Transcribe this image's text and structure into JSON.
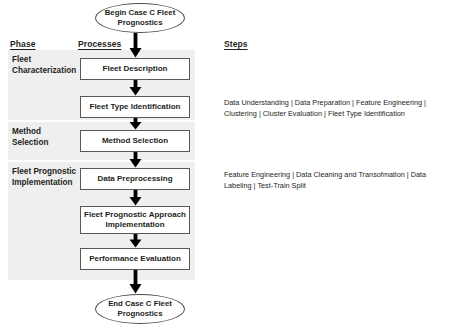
{
  "diagram": {
    "band_color": "#efefef",
    "line_color": "#595959",
    "text_color": "#231f20"
  },
  "headers": {
    "phase": "Phase",
    "processes": "Processes",
    "steps": "Steps"
  },
  "terminators": {
    "start": "Begin Case C Fleet Prognostics",
    "end": "End Case C Fleet Prognostics"
  },
  "phases": [
    {
      "label": "Fleet Characterization"
    },
    {
      "label": "Method Selection"
    },
    {
      "label": "Fleet Prognostic Implementation"
    }
  ],
  "processes": [
    {
      "label": "Fleet Description"
    },
    {
      "label": "Fleet Type Identification"
    },
    {
      "label": "Method Selection"
    },
    {
      "label": "Data Preprocessing"
    },
    {
      "label": "Fleet Prognostic Approach Implementation"
    },
    {
      "label": "Performance Evaluation"
    }
  ],
  "steps": [
    {
      "text": "Data Understanding | Data Preparation | Feature Engineering | Clustering | Cluster Evaluation | Fleet Type Identification"
    },
    {
      "text": "Feature Engineering | Data Cleaning and Transofmation | Data Labeling | Test-Train Split"
    }
  ]
}
